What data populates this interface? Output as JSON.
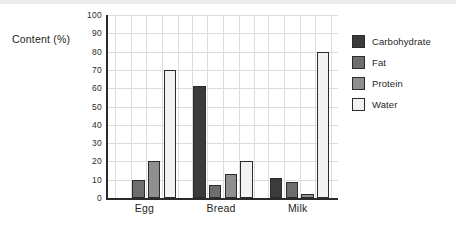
{
  "chart_data": {
    "type": "bar",
    "title": "",
    "xlabel": "",
    "ylabel": "Content (%)",
    "ylim": [
      0,
      100
    ],
    "yticks": [
      0,
      10,
      20,
      30,
      40,
      50,
      60,
      70,
      80,
      90,
      100
    ],
    "ytick_labels": [
      "0",
      "10",
      "20",
      "30",
      "40",
      "50",
      "60",
      "70",
      "80",
      "90",
      "100"
    ],
    "grid": true,
    "legend_position": "right",
    "categories": [
      "Egg",
      "Bread",
      "Milk"
    ],
    "series": [
      {
        "name": "Carbohydrate",
        "color": "#3b3b3b",
        "values": [
          0,
          61,
          11
        ]
      },
      {
        "name": "Fat",
        "color": "#6e6e6e",
        "values": [
          10,
          7,
          9
        ]
      },
      {
        "name": "Protein",
        "color": "#8f8f8f",
        "values": [
          20,
          13,
          2
        ]
      },
      {
        "name": "Water",
        "color": "#f2f2f2",
        "values": [
          70,
          20,
          80
        ]
      }
    ]
  },
  "axis": {
    "y_title": "Content (%)"
  },
  "legend": {
    "entries": [
      {
        "label": "Carbohydrate",
        "swatch": "#3b3b3b"
      },
      {
        "label": "Fat",
        "swatch": "#6e6e6e"
      },
      {
        "label": "Protein",
        "swatch": "#8f8f8f"
      },
      {
        "label": "Water",
        "swatch": "#f2f2f2"
      }
    ]
  },
  "style": {
    "axis_color": "#2b2b2b",
    "grid_color": "#dcdcdc",
    "background": "#ffffff"
  }
}
